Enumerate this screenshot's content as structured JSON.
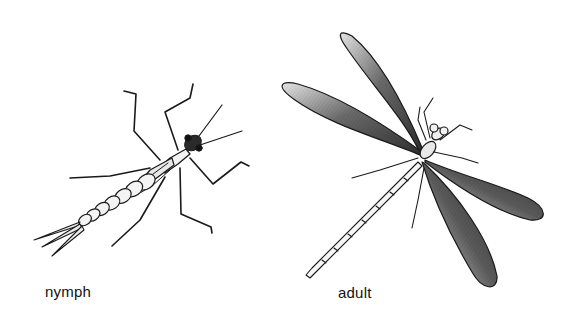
{
  "figure": {
    "specimens": [
      {
        "id": "nymph",
        "label": "nymph"
      },
      {
        "id": "adult",
        "label": "adult"
      }
    ]
  },
  "colors": {
    "background": "#ffffff",
    "ink": "#1a1a1a",
    "wing_shade": "#3a3a3a",
    "wing_light": "#bdbdbd"
  }
}
